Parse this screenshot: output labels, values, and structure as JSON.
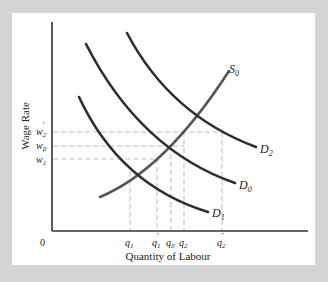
{
  "diagram": {
    "type": "labour-market supply and demand",
    "y_axis_label": "Wage Rate",
    "x_axis_label": "Quantity of Labour",
    "origin_label": "0",
    "curves": {
      "supply": {
        "name": "S",
        "sub": "0"
      },
      "demand_0": {
        "name": "D",
        "sub": "0"
      },
      "demand_1": {
        "name": "D",
        "sub": "1"
      },
      "demand_2": {
        "name": "D",
        "sub": "2"
      }
    },
    "wage_ticks": [
      {
        "name": "w",
        "sub": "2",
        "prime": "′"
      },
      {
        "name": "w",
        "sub": "0",
        "prime": ""
      },
      {
        "name": "w",
        "sub": "1",
        "prime": "′"
      }
    ],
    "quantity_ticks": [
      {
        "name": "q",
        "sub": "1",
        "prime": ""
      },
      {
        "name": "q",
        "sub": "1",
        "prime": "′"
      },
      {
        "name": "q",
        "sub": "0",
        "prime": ""
      },
      {
        "name": "q",
        "sub": "2",
        "prime": ""
      },
      {
        "name": "q",
        "sub": "2",
        "prime": "′"
      }
    ]
  },
  "colors": {
    "background": "#d4d4d4",
    "panel": "#ffffff",
    "curve": "#2e2e2e",
    "supply": "#555555",
    "dashed": "#bdbdbd",
    "axis": "#333333"
  }
}
